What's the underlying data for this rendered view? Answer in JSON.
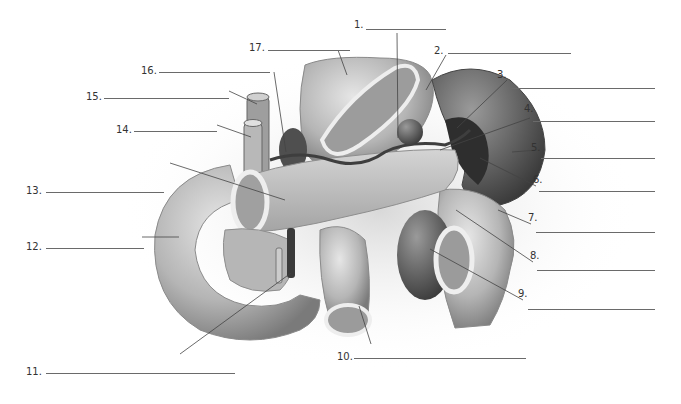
{
  "figure": {
    "colors": {
      "background": "#ffffff",
      "organ_light": "#d9d9d9",
      "organ_mid": "#a8a8a8",
      "organ_dark": "#5f5f5f",
      "vessel": "#3e3e3e",
      "line": "#6a6a6a",
      "text": "#333333"
    }
  },
  "labels": [
    {
      "num": "1.",
      "x": 354,
      "y": 25,
      "line_x1": 366,
      "line_x2": 446,
      "line_y": 29
    },
    {
      "num": "2.",
      "x": 434,
      "y": 48,
      "line_x1": 448,
      "line_x2": 571,
      "line_y": 53
    },
    {
      "num": "3.",
      "x": 497,
      "y": 73,
      "line_x1": 510,
      "line_x2": 655,
      "line_y": 88
    },
    {
      "num": "4.",
      "x": 524,
      "y": 106,
      "line_x1": 533,
      "line_x2": 655,
      "line_y": 121
    },
    {
      "num": "5.",
      "x": 531,
      "y": 144,
      "line_x1": 541,
      "line_x2": 655,
      "line_y": 158
    },
    {
      "num": "6.",
      "x": 533,
      "y": 175,
      "line_x1": 539,
      "line_x2": 655,
      "line_y": 191
    },
    {
      "num": "7.",
      "x": 528,
      "y": 211,
      "line_x1": 536,
      "line_x2": 655,
      "line_y": 232
    },
    {
      "num": "8.",
      "x": 530,
      "y": 249,
      "line_x1": 537,
      "line_x2": 655,
      "line_y": 270
    },
    {
      "num": "9.",
      "x": 518,
      "y": 287,
      "line_x1": 528,
      "line_x2": 655,
      "line_y": 309
    },
    {
      "num": "10.",
      "x": 337,
      "y": 352,
      "line_x1": 354,
      "line_x2": 526,
      "line_y": 358
    },
    {
      "num": "11.",
      "x": 26,
      "y": 368,
      "line_x1": 46,
      "line_x2": 235,
      "line_y": 373
    },
    {
      "num": "12.",
      "x": 26,
      "y": 241,
      "line_x1": 46,
      "line_x2": 144,
      "line_y": 248
    },
    {
      "num": "13.",
      "x": 26,
      "y": 187,
      "line_x1": 46,
      "line_x2": 164,
      "line_y": 192
    },
    {
      "num": "14.",
      "x": 116,
      "y": 125,
      "line_x1": 134,
      "line_x2": 217,
      "line_y": 131
    },
    {
      "num": "15.",
      "x": 86,
      "y": 92,
      "line_x1": 104,
      "line_x2": 229,
      "line_y": 98
    },
    {
      "num": "16.",
      "x": 141,
      "y": 67,
      "line_x1": 159,
      "line_x2": 270,
      "line_y": 72
    },
    {
      "num": "17.",
      "x": 249,
      "y": 44,
      "line_x1": 268,
      "line_x2": 350,
      "line_y": 50
    }
  ]
}
